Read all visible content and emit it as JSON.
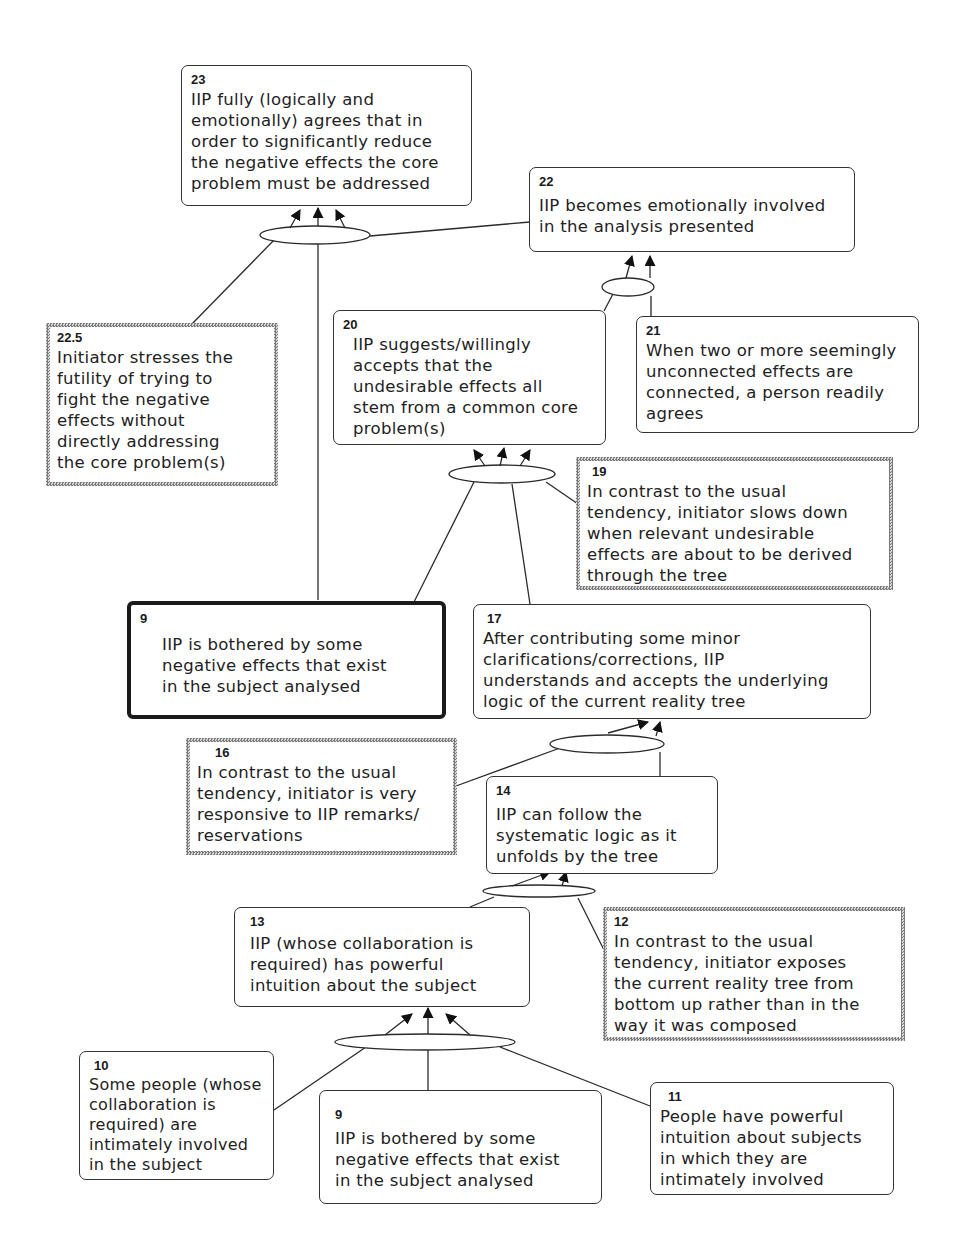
{
  "diagram": {
    "type": "current-reality-tree",
    "nodes": {
      "n23": {
        "id": "23",
        "text": "IIP fully (logically and\nemotionally) agrees that in\norder to significantly reduce\nthe negative effects the core\nproblem must be addressed",
        "style": "rounded"
      },
      "n22": {
        "id": "22",
        "text": "IIP becomes emotionally involved\nin the analysis presented",
        "style": "rounded"
      },
      "n22_5": {
        "id": "22.5",
        "text": "Initiator stresses the\nfutility of trying to\nfight the negative\neffects without\ndirectly addressing\nthe core problem(s)",
        "style": "dotted"
      },
      "n20": {
        "id": "20",
        "text": "IIP suggests/willingly\naccepts that the\nundesirable effects all\nstem from a common core\nproblem(s)",
        "style": "rounded"
      },
      "n21": {
        "id": "21",
        "text": "When two or more seemingly\nunconnected effects are\nconnected, a person readily\nagrees",
        "style": "rounded"
      },
      "n19": {
        "id": "19",
        "text": "In contrast to the usual\ntendency, initiator slows down\nwhen relevant undesirable\neffects are about to be derived\nthrough the tree",
        "style": "dotted"
      },
      "n9_top": {
        "id": "9",
        "text": "IIP is bothered by some\nnegative effects that exist\nin the subject analysed",
        "style": "bold"
      },
      "n17": {
        "id": "17",
        "text": "After contributing some minor\nclarifications/corrections, IIP\nunderstands and accepts the underlying\nlogic of the current reality tree",
        "style": "rounded"
      },
      "n16": {
        "id": "16",
        "text": "In contrast to the usual\ntendency, initiator is very\nresponsive to IIP remarks/\nreservations",
        "style": "dotted"
      },
      "n14": {
        "id": "14",
        "text": "IIP can follow the\nsystematic logic as it\nunfolds by the tree",
        "style": "rounded"
      },
      "n12": {
        "id": "12",
        "text": "In contrast to the usual\ntendency, initiator exposes\nthe current reality tree from\nbottom up rather than in the\nway it was composed",
        "style": "dotted"
      },
      "n13": {
        "id": "13",
        "text": "IIP (whose collaboration is\nrequired) has powerful\nintuition about the subject",
        "style": "rounded"
      },
      "n10": {
        "id": "10",
        "text": "Some people (whose\ncollaboration is\nrequired) are\nintimately involved\nin  the subject",
        "style": "rounded"
      },
      "n9_bottom": {
        "id": "9",
        "text": "IIP is bothered by some\nnegative effects that exist\nin the subject analysed",
        "style": "rounded"
      },
      "n11": {
        "id": "11",
        "text": "People have powerful\nintuition about subjects\nin which they are\nintimately involved",
        "style": "rounded"
      }
    },
    "links": [
      {
        "from": [
          "22.5",
          "9",
          "22"
        ],
        "to": "23",
        "type": "and-ellipse"
      },
      {
        "from": [
          "20",
          "21"
        ],
        "to": "22",
        "type": "and-ellipse"
      },
      {
        "from": [
          "9",
          "17",
          "19"
        ],
        "to": "20",
        "type": "and-ellipse"
      },
      {
        "from": [
          "16",
          "14"
        ],
        "to": "17",
        "type": "and-ellipse"
      },
      {
        "from": [
          "13",
          "12"
        ],
        "to": "14",
        "type": "and-ellipse"
      },
      {
        "from": [
          "10",
          "9",
          "11"
        ],
        "to": "13",
        "type": "and-ellipse"
      }
    ],
    "colors": {
      "line": "#2a2a2a",
      "border": "#333333",
      "background": "#ffffff"
    }
  }
}
